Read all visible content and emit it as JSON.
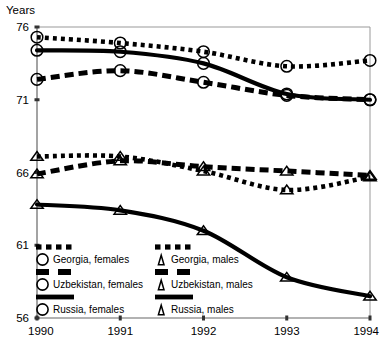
{
  "chart_data": {
    "type": "line",
    "title": "",
    "subtitle": "",
    "ylabel": "Years",
    "xlabel": "",
    "x": [
      1990,
      1991,
      1992,
      1993,
      1994
    ],
    "xticklabels": [
      "1990",
      "1991",
      "1992",
      "1993",
      "1994"
    ],
    "yticklabels": [
      "76",
      "71",
      "66",
      "61",
      "56"
    ],
    "yticks": [
      76,
      71,
      66,
      61,
      56
    ],
    "ylim": [
      56,
      76
    ],
    "xlim": [
      1990,
      1994
    ],
    "grid": false,
    "legend_position": "inside-bottom-left",
    "series": [
      {
        "name": "Georgia, females",
        "marker": "circle",
        "linestyle": "dotted",
        "color": "#000000",
        "values": [
          75.3,
          74.9,
          74.3,
          73.3,
          73.7
        ]
      },
      {
        "name": "Georgia, males",
        "marker": "triangle",
        "linestyle": "dotted",
        "color": "#000000",
        "values": [
          67.1,
          67.1,
          66.1,
          64.8,
          65.7
        ]
      },
      {
        "name": "Uzbekistan, females",
        "marker": "circle",
        "linestyle": "dashed",
        "color": "#000000",
        "values": [
          72.4,
          73.0,
          72.2,
          71.3,
          71.0
        ]
      },
      {
        "name": "Uzbekistan, males",
        "marker": "triangle",
        "linestyle": "dashed",
        "color": "#000000",
        "values": [
          65.9,
          66.8,
          66.4,
          66.1,
          65.8
        ]
      },
      {
        "name": "Russia, females",
        "marker": "circle",
        "linestyle": "solid",
        "color": "#000000",
        "values": [
          74.4,
          74.3,
          73.5,
          71.4,
          71.0
        ]
      },
      {
        "name": "Russia, males",
        "marker": "triangle",
        "linestyle": "solid",
        "color": "#000000",
        "values": [
          63.8,
          63.4,
          62.0,
          58.8,
          57.5
        ]
      }
    ]
  },
  "axes": {
    "ylabel": "Years",
    "yticks": [
      "76",
      "71",
      "66",
      "61",
      "56"
    ],
    "xticks": [
      "1990",
      "1991",
      "1992",
      "1993",
      "1994"
    ]
  },
  "legend": {
    "rows": [
      {
        "left": "Georgia, females",
        "right": "Georgia, males"
      },
      {
        "left": "Uzbekistan, females",
        "right": "Uzbekistan, males"
      },
      {
        "left": "Russia, females",
        "right": "Russia, males"
      }
    ]
  },
  "colors": {
    "ink": "#000000",
    "frame": "#555555",
    "background": "#ffffff"
  }
}
